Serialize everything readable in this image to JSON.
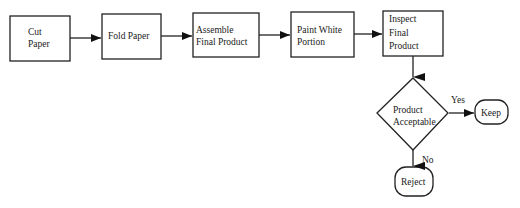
{
  "diagram": {
    "nodes": [
      {
        "id": "cut",
        "label": "Cut\nPaper",
        "shape": "rect"
      },
      {
        "id": "fold",
        "label": "Fold Paper",
        "shape": "rect"
      },
      {
        "id": "assemble",
        "label": "Assemble\nFinal Product",
        "shape": "rect"
      },
      {
        "id": "paint",
        "label": "Paint White\nPortion",
        "shape": "rect"
      },
      {
        "id": "inspect",
        "label": "Inspect\nFinal\nProduct",
        "shape": "rect"
      },
      {
        "id": "decision",
        "label": "Product\nAcceptable",
        "shape": "diamond"
      },
      {
        "id": "keep",
        "label": "Keep",
        "shape": "rounded"
      },
      {
        "id": "reject",
        "label": "Reject",
        "shape": "rounded"
      }
    ],
    "edges": [
      {
        "from": "cut",
        "to": "fold",
        "label": ""
      },
      {
        "from": "fold",
        "to": "assemble",
        "label": ""
      },
      {
        "from": "assemble",
        "to": "paint",
        "label": ""
      },
      {
        "from": "paint",
        "to": "inspect",
        "label": ""
      },
      {
        "from": "inspect",
        "to": "decision",
        "label": ""
      },
      {
        "from": "decision",
        "to": "keep",
        "label": "Yes"
      },
      {
        "from": "decision",
        "to": "reject",
        "label": "No"
      }
    ],
    "yes_label": "Yes",
    "no_label": "No"
  }
}
